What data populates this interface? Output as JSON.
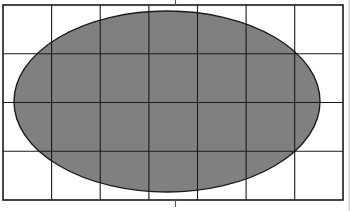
{
  "figure": {
    "background_color": "#ffffff",
    "width": 352,
    "height": 211
  },
  "grid": {
    "label": "coordinate-grid",
    "columns": 7,
    "rows": 4,
    "cell_width": 48.6,
    "cell_height": 48.8,
    "x_start": 3,
    "x_end": 343,
    "y_start": 5,
    "y_end": 200,
    "line_color": "#1a1a1a",
    "border_color": "#1a1a1a",
    "line_width": 1.1,
    "border_width": 1.6,
    "vertical_line_positions": [
      3,
      51.6,
      100.2,
      148.9,
      197.5,
      246.1,
      294.7,
      343
    ],
    "horizontal_line_positions": [
      5,
      53.8,
      102.5,
      151.3,
      200
    ]
  },
  "ellipse": {
    "label": "shaded-ellipse",
    "center_x": 167,
    "center_y": 101.5,
    "radius_x": 153,
    "radius_y": 90.5,
    "fill_color": "#808080",
    "stroke_color": "#1a1a1a",
    "stroke_width": 1.4,
    "left_extent": 14,
    "right_extent": 320,
    "top_extent": 11,
    "bottom_extent": 192
  },
  "ticks": {
    "label": "center-tick-marks",
    "x_position": 175.5,
    "color": "#555555",
    "line_width": 1.1,
    "top": {
      "y_start": 0,
      "y_end": 5.5
    },
    "bottom": {
      "y_start": 200,
      "y_end": 207
    }
  },
  "artifacts": {
    "right_edge_rule": {
      "label": "page-edge-rule",
      "x": 349.2,
      "y_start": 0,
      "y_end": 211,
      "color": "#b5b5b5",
      "line_width": 0.9
    }
  },
  "chart_data": {
    "type": "scatter",
    "xlabel": "",
    "ylabel": "",
    "grid": true,
    "legend": "none",
    "xlim": [
      0,
      7
    ],
    "ylim": [
      0,
      4
    ],
    "x_tick_labels": [
      "0",
      "1",
      "2",
      "3",
      "4",
      "5",
      "6",
      "7"
    ],
    "y_tick_labels": [
      "0",
      "1",
      "2",
      "3",
      "4"
    ],
    "shapes": [
      {
        "kind": "ellipse",
        "center": [
          3.375,
          2.0
        ],
        "semi_axis_x": 3.15,
        "semi_axis_y": 1.855,
        "fill": "#808080",
        "edge": "#1a1a1a",
        "filled": true
      }
    ],
    "annotations": [
      {
        "kind": "tick",
        "axis": "x",
        "value": 3.55,
        "position": "top-and-bottom",
        "label": ""
      }
    ]
  }
}
